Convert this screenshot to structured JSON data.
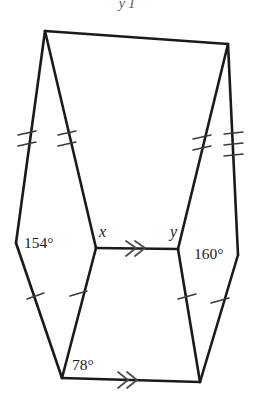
{
  "figure": {
    "title_fragment": "y      1",
    "background_color": "#ffffff",
    "stroke_color": "#1a1a1a",
    "tick_color": "#3a3a3a",
    "labels": {
      "angle_left": "154°",
      "angle_right": "160°",
      "angle_bottom": "78°",
      "vertex_x": "x",
      "vertex_y": "y"
    },
    "vertices": {
      "top_left": [
        45,
        31
      ],
      "top_right": [
        228,
        44
      ],
      "left_outer": [
        16,
        243
      ],
      "right_outer": [
        238,
        255
      ],
      "inner_left": [
        96,
        248
      ],
      "inner_right": [
        178,
        249
      ],
      "bottom_left": [
        62,
        378
      ],
      "bottom_right": [
        200,
        382
      ]
    },
    "edges": [
      {
        "name": "top-edge",
        "from": "top_left",
        "to": "top_right",
        "ticks": 0
      },
      {
        "name": "left-upper-outer",
        "from": "top_left",
        "to": "left_outer",
        "ticks": 2
      },
      {
        "name": "left-upper-inner",
        "from": "top_left",
        "to": "inner_left",
        "ticks": 2
      },
      {
        "name": "right-upper-inner",
        "from": "top_right",
        "to": "inner_right",
        "ticks": 2
      },
      {
        "name": "right-upper-outer",
        "from": "top_right",
        "to": "right_outer",
        "ticks": 3
      },
      {
        "name": "middle-segment",
        "from": "inner_left",
        "to": "inner_right",
        "ticks": 0,
        "arrows": 2
      },
      {
        "name": "left-lower-outer",
        "from": "left_outer",
        "to": "bottom_left",
        "ticks": 1
      },
      {
        "name": "left-lower-inner",
        "from": "inner_left",
        "to": "bottom_left",
        "ticks": 1
      },
      {
        "name": "right-lower-inner",
        "from": "inner_right",
        "to": "bottom_right",
        "ticks": 1
      },
      {
        "name": "right-lower-outer",
        "from": "right_outer",
        "to": "bottom_right",
        "ticks": 1
      },
      {
        "name": "bottom-edge",
        "from": "bottom_left",
        "to": "bottom_right",
        "ticks": 0,
        "arrows": 2
      }
    ]
  }
}
